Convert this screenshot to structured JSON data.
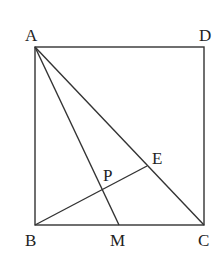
{
  "diagram": {
    "type": "geometry",
    "shape": "square ABCD",
    "points": {
      "A": {
        "label": "A",
        "x": 35,
        "y": 47
      },
      "D": {
        "label": "D",
        "x": 204,
        "y": 47
      },
      "B": {
        "label": "B",
        "x": 35,
        "y": 225
      },
      "C": {
        "label": "C",
        "x": 204,
        "y": 225
      },
      "M": {
        "label": "M",
        "x": 119,
        "y": 225
      },
      "E": {
        "label": "E",
        "x": 147,
        "y": 166
      },
      "P": {
        "label": "P",
        "x": 104,
        "y": 190
      }
    },
    "segments": [
      "AB",
      "BC",
      "CD",
      "DA",
      "AC",
      "AM",
      "BE"
    ],
    "colors": {
      "stroke": "#333333",
      "text": "#222222",
      "background": "#ffffff"
    }
  }
}
